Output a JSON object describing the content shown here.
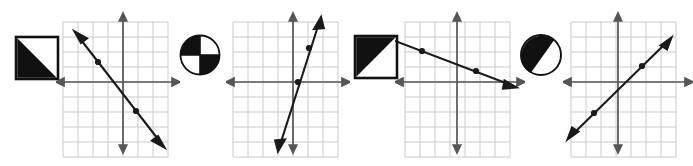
{
  "page": {
    "background_color": "#ffffff",
    "width": 693,
    "height": 166,
    "item_count": 4
  },
  "style": {
    "grid_line_color": "#c8c8d2",
    "axis_color": "#55555a",
    "line_color": "#1a1a1a",
    "icon_fill_color": "#111111",
    "icon_stroke_color": "#111111",
    "grid_step_px": 15
  },
  "items": [
    {
      "index": 1,
      "icon": {
        "name": "square-lower-left-triangle-shaded",
        "shape": "square",
        "shaded_part": "lower-left-triangle",
        "fraction_label": "1/2"
      },
      "graph": {
        "name": "graph-negative-steep-through-origin",
        "x_range": [
          -5,
          5
        ],
        "y_range": [
          -5,
          4
        ],
        "slope": -2,
        "intercept": 0,
        "direction": "decreasing",
        "plotted_points": [
          [
            -1.6,
            3.2
          ],
          [
            1.2,
            -2.4
          ]
        ],
        "has_arrows_both_ends": "true"
      }
    },
    {
      "index": 2,
      "icon": {
        "name": "circle-checkerboard-quadrants",
        "shape": "circle",
        "shaded_part": "opposite-quadrants",
        "fraction_label": "1/2"
      },
      "graph": {
        "name": "graph-positive-steep",
        "x_range": [
          -5,
          5
        ],
        "y_range": [
          -5,
          4
        ],
        "slope": 3,
        "intercept": -1,
        "direction": "increasing",
        "plotted_points": [
          [
            0.35,
            0
          ],
          [
            1.45,
            3.2
          ]
        ],
        "has_arrows_both_ends": "true"
      }
    },
    {
      "index": 3,
      "icon": {
        "name": "square-upper-left-triangle-shaded",
        "shape": "square",
        "shaded_part": "upper-left-triangle",
        "fraction_label": "1/2"
      },
      "graph": {
        "name": "graph-negative-shallow",
        "x_range": [
          -5,
          5
        ],
        "y_range": [
          -5,
          4
        ],
        "slope": -0.5,
        "intercept": 0.75,
        "direction": "decreasing",
        "plotted_points": [
          [
            -3.0,
            2.2
          ],
          [
            0.9,
            0.3
          ]
        ],
        "has_arrows_both_ends": "true"
      }
    },
    {
      "index": 4,
      "icon": {
        "name": "circle-diagonal-shaded",
        "shape": "circle",
        "shaded_part": "diagonal-major-segment",
        "fraction_label": "1/2"
      },
      "graph": {
        "name": "graph-positive-moderate-through-origin",
        "x_range": [
          -5,
          5
        ],
        "y_range": [
          -5,
          4
        ],
        "slope": 1,
        "intercept": 0,
        "direction": "increasing",
        "plotted_points": [
          [
            -1.6,
            -1.6
          ],
          [
            1.7,
            1.7
          ]
        ],
        "has_arrows_both_ends": "true"
      }
    }
  ]
}
